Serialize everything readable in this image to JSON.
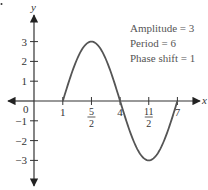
{
  "chart_data": {
    "type": "line",
    "title": "",
    "xlabel": "x",
    "ylabel": "y",
    "function": "y = 3 sin((π/3)(x - 1))",
    "x_ticks": [
      {
        "value": 1,
        "label": "1"
      },
      {
        "value": 2.5,
        "label": "5/2",
        "num": "5",
        "den": "2"
      },
      {
        "value": 4,
        "label": "4"
      },
      {
        "value": 5.5,
        "label": "11/2",
        "num": "11",
        "den": "2"
      },
      {
        "value": 7,
        "label": "7"
      }
    ],
    "y_ticks": [
      {
        "value": 3,
        "label": "3"
      },
      {
        "value": 2,
        "label": "2"
      },
      {
        "value": 1,
        "label": "1"
      },
      {
        "value": -1,
        "label": "−1"
      },
      {
        "value": -2,
        "label": "−2"
      },
      {
        "value": -3,
        "label": "−3"
      }
    ],
    "origin_label": "0",
    "key_points": [
      {
        "x": 1,
        "y": 0
      },
      {
        "x": 2.5,
        "y": 3
      },
      {
        "x": 4,
        "y": 0
      },
      {
        "x": 5.5,
        "y": -3
      },
      {
        "x": 7,
        "y": 0
      }
    ],
    "xlim": [
      0,
      7.5
    ],
    "ylim": [
      -4,
      4
    ],
    "grid": false,
    "annotations": [
      "Amplitude = 3",
      "Period = 6",
      "Phase shift = 1"
    ],
    "curve_color": "#555555",
    "axis_color": "#222222"
  }
}
